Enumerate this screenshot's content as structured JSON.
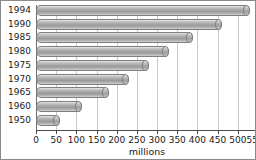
{
  "chart_data": {
    "type": "bar",
    "orientation": "horizontal",
    "title": "",
    "subtitle": "",
    "xlabel": "millions",
    "ylabel": "",
    "categories": [
      "1994",
      "1990",
      "1985",
      "1980",
      "1975",
      "1970",
      "1965",
      "1960",
      "1950"
    ],
    "values": [
      530,
      460,
      390,
      330,
      280,
      230,
      180,
      115,
      60
    ],
    "series": [
      {
        "name": "millions",
        "values": [
          530,
          460,
          390,
          330,
          280,
          230,
          180,
          115,
          60
        ]
      }
    ],
    "xlim": [
      0,
      550
    ],
    "xticks": [
      0,
      50,
      100,
      150,
      200,
      250,
      300,
      350,
      400,
      450,
      500,
      550
    ],
    "xtick_labels": [
      "0",
      "50",
      "100",
      "150",
      "200",
      "250",
      "300",
      "350",
      "400",
      "450",
      "500",
      "550"
    ],
    "grid": true,
    "grid_axis": "x",
    "legend": false,
    "legend_position": "none",
    "annotations": [],
    "bar_style": "cylinder-3d",
    "colors": {
      "bar_fill_light": "#e8e8e8",
      "bar_fill_mid": "#a9a9a9",
      "bar_fill_dark": "#9a9a9a",
      "bar_border": "#7f7f7f",
      "gridline": "#c9c9c9",
      "axis": "#4a4a4a",
      "frame_border": "#8a8a8a",
      "background": "#ffffff",
      "text": "#1a1a1a"
    }
  }
}
